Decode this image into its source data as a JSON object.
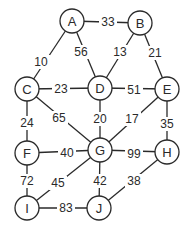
{
  "diagram": {
    "type": "weighted-undirected-graph",
    "colors": {
      "stroke": "#2a2a2a",
      "background": "#ffffff"
    },
    "nodes": [
      {
        "id": "A",
        "label": "A",
        "x": 72,
        "y": 21
      },
      {
        "id": "B",
        "label": "B",
        "x": 140,
        "y": 23
      },
      {
        "id": "C",
        "label": "C",
        "x": 27,
        "y": 89
      },
      {
        "id": "D",
        "label": "D",
        "x": 100,
        "y": 88
      },
      {
        "id": "E",
        "label": "E",
        "x": 167,
        "y": 89
      },
      {
        "id": "F",
        "label": "F",
        "x": 27,
        "y": 153
      },
      {
        "id": "G",
        "label": "G",
        "x": 100,
        "y": 150
      },
      {
        "id": "H",
        "label": "H",
        "x": 167,
        "y": 152
      },
      {
        "id": "I",
        "label": "I",
        "x": 27,
        "y": 208
      },
      {
        "id": "J",
        "label": "J",
        "x": 99,
        "y": 208
      }
    ],
    "edges": [
      {
        "from": "A",
        "to": "B",
        "weight": "33",
        "lx": 108,
        "ly": 22
      },
      {
        "from": "A",
        "to": "D",
        "weight": "56",
        "lx": 81,
        "ly": 52
      },
      {
        "from": "B",
        "to": "D",
        "weight": "13",
        "lx": 120,
        "ly": 52
      },
      {
        "from": "B",
        "to": "E",
        "weight": "21",
        "lx": 155,
        "ly": 53
      },
      {
        "from": "A",
        "to": "C",
        "weight": "10",
        "lx": 41,
        "ly": 62
      },
      {
        "from": "C",
        "to": "D",
        "weight": "23",
        "lx": 61,
        "ly": 89
      },
      {
        "from": "D",
        "to": "E",
        "weight": "51",
        "lx": 134,
        "ly": 90
      },
      {
        "from": "C",
        "to": "F",
        "weight": "24",
        "lx": 27,
        "ly": 123
      },
      {
        "from": "C",
        "to": "G",
        "weight": "65",
        "lx": 59,
        "ly": 118
      },
      {
        "from": "D",
        "to": "G",
        "weight": "20",
        "lx": 100,
        "ly": 119
      },
      {
        "from": "E",
        "to": "G",
        "weight": "17",
        "lx": 132,
        "ly": 119
      },
      {
        "from": "E",
        "to": "H",
        "weight": "35",
        "lx": 167,
        "ly": 124
      },
      {
        "from": "F",
        "to": "G",
        "weight": "40",
        "lx": 67,
        "ly": 153
      },
      {
        "from": "G",
        "to": "H",
        "weight": "99",
        "lx": 134,
        "ly": 154
      },
      {
        "from": "F",
        "to": "I",
        "weight": "72",
        "lx": 27,
        "ly": 181
      },
      {
        "from": "G",
        "to": "I",
        "weight": "45",
        "lx": 58,
        "ly": 183
      },
      {
        "from": "G",
        "to": "J",
        "weight": "42",
        "lx": 100,
        "ly": 181
      },
      {
        "from": "H",
        "to": "J",
        "weight": "38",
        "lx": 134,
        "ly": 181
      },
      {
        "from": "I",
        "to": "J",
        "weight": "83",
        "lx": 66,
        "ly": 208
      }
    ],
    "node_radius": 12
  }
}
